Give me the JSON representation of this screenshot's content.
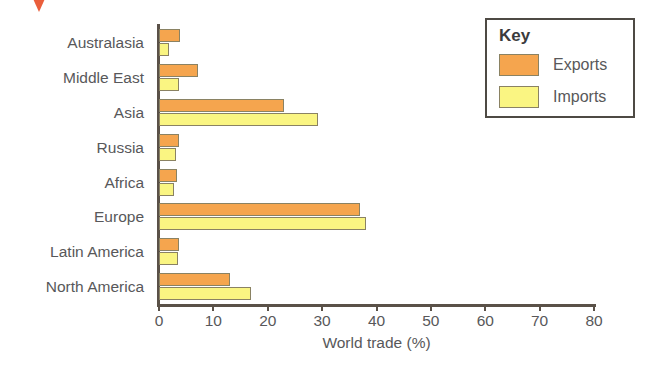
{
  "chart_data": {
    "type": "bar",
    "orientation": "horizontal",
    "title": "",
    "xlabel": "World trade (%)",
    "ylabel": "",
    "xlim": [
      0,
      80
    ],
    "xticks": [
      0,
      10,
      20,
      30,
      40,
      50,
      60,
      70,
      80
    ],
    "grid": false,
    "legend_position": "top-right",
    "legend_title": "Key",
    "categories": [
      "Australasia",
      "Middle East",
      "Asia",
      "Russia",
      "Africa",
      "Europe",
      "Latin America",
      "North America"
    ],
    "series": [
      {
        "name": "Exports",
        "color": "#F5A54E",
        "values": [
          3.9,
          7.1,
          23.0,
          3.7,
          3.3,
          36.9,
          3.7,
          13.1
        ]
      },
      {
        "name": "Imports",
        "color": "#FAF582",
        "values": [
          1.9,
          3.6,
          29.3,
          3.1,
          2.8,
          38.1,
          3.5,
          16.9
        ]
      }
    ]
  },
  "legend": {
    "title": "Key",
    "entries": [
      {
        "label": "Exports",
        "color": "#F5A54E"
      },
      {
        "label": "Imports",
        "color": "#FAF582"
      }
    ]
  },
  "axis": {
    "x_title": "World trade (%)",
    "tick_labels": [
      "0",
      "10",
      "20",
      "30",
      "40",
      "50",
      "60",
      "70",
      "80"
    ]
  },
  "colors": {
    "exports": "#F5A54E",
    "imports": "#FAF582",
    "bar_outline": "#8A8263",
    "axis": "#5A5148",
    "text": "#58585A",
    "marker": "#E8502A",
    "background": "#FFFFFF"
  }
}
